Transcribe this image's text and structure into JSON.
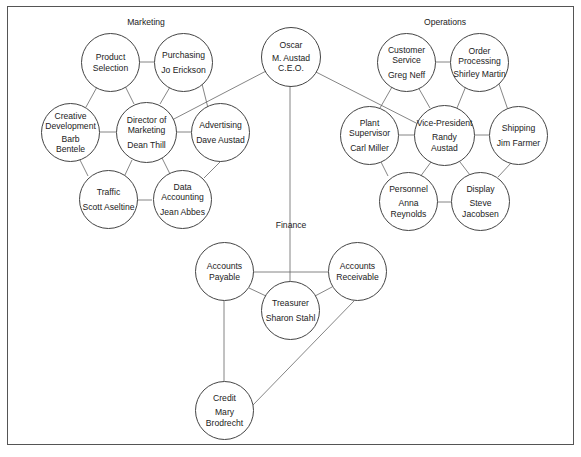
{
  "sections": {
    "marketing": "Marketing",
    "operations": "Operations",
    "finance": "Finance"
  },
  "nodes": {
    "ceo": {
      "title": "Oscar",
      "person": "M. Austad\nC.E.O."
    },
    "product_selection": {
      "title": "Product\nSelection",
      "person": ""
    },
    "purchasing": {
      "title": "Purchasing",
      "person": "Jo Erickson"
    },
    "creative_development": {
      "title": "Creative\nDevelopment",
      "person": "Barb\nBentele"
    },
    "director_marketing": {
      "title": "Director of\nMarketing",
      "person": "Dean Thill"
    },
    "advertising": {
      "title": "Advertising",
      "person": "Dave Austad"
    },
    "traffic": {
      "title": "Traffic",
      "person": "Scott Aseltine"
    },
    "data_accounting": {
      "title": "Data\nAccounting",
      "person": "Jean Abbes"
    },
    "customer_service": {
      "title": "Customer\nService",
      "person": "Greg Neff"
    },
    "order_processing": {
      "title": "Order\nProcessing",
      "person": "Shirley Martin"
    },
    "plant_supervisor": {
      "title": "Plant\nSupervisor",
      "person": "Carl Miller"
    },
    "vice_president": {
      "title": "Vice-President",
      "person": "Randy\nAustad"
    },
    "shipping": {
      "title": "Shipping",
      "person": "Jim Farmer"
    },
    "personnel": {
      "title": "Personnel",
      "person": "Anna\nReynolds"
    },
    "display": {
      "title": "Display",
      "person": "Steve\nJacobsen"
    },
    "accounts_payable": {
      "title": "Accounts\nPayable",
      "person": ""
    },
    "accounts_receivable": {
      "title": "Accounts\nReceivable",
      "person": ""
    },
    "treasurer": {
      "title": "Treasurer",
      "person": "Sharon Stahl"
    },
    "credit": {
      "title": "Credit",
      "person": "Mary\nBrodrecht"
    }
  },
  "colors": {
    "line": "#555555",
    "border": "#444444",
    "text": "#222222",
    "background": "#ffffff"
  }
}
